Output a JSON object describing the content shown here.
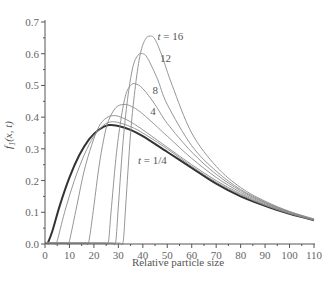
{
  "chart_data": {
    "type": "line",
    "title": "",
    "xlabel": "Relative particle size",
    "ylabel": "f1(x, t)",
    "xlim": [
      0,
      110
    ],
    "ylim": [
      0,
      0.7
    ],
    "grid": false,
    "legend": "none (inline curve labels)",
    "x_ticks": [
      0,
      10,
      20,
      30,
      40,
      50,
      60,
      70,
      80,
      90,
      100,
      110
    ],
    "y_ticks": [
      "0.0",
      "0.1",
      "0.2",
      "0.3",
      "0.4",
      "0.5",
      "0.6",
      "0.7"
    ],
    "annotations": [
      {
        "text": "t = 16",
        "x": 46,
        "y": 0.655
      },
      {
        "text": "12",
        "x": 47,
        "y": 0.585
      },
      {
        "text": "8",
        "x": 44,
        "y": 0.485
      },
      {
        "text": "4",
        "x": 43,
        "y": 0.42
      },
      {
        "text": "t = 1/4",
        "x": 38,
        "y": 0.265
      }
    ],
    "series": [
      {
        "name": "t = 1/4",
        "thick": true,
        "points": [
          [
            1,
            0
          ],
          [
            3,
            0.04
          ],
          [
            6,
            0.12
          ],
          [
            10,
            0.21
          ],
          [
            14,
            0.28
          ],
          [
            18,
            0.33
          ],
          [
            22,
            0.36
          ],
          [
            26,
            0.375
          ],
          [
            30,
            0.372
          ],
          [
            35,
            0.36
          ],
          [
            40,
            0.34
          ],
          [
            50,
            0.29
          ],
          [
            60,
            0.24
          ],
          [
            70,
            0.19
          ],
          [
            80,
            0.15
          ],
          [
            90,
            0.12
          ],
          [
            100,
            0.095
          ],
          [
            110,
            0.075
          ]
        ]
      },
      {
        "name": "t (unlabeled, ~1/2)",
        "thick": false,
        "points": [
          [
            4,
            0
          ],
          [
            5,
            0.01
          ],
          [
            8,
            0.1
          ],
          [
            12,
            0.2
          ],
          [
            16,
            0.28
          ],
          [
            20,
            0.34
          ],
          [
            24,
            0.375
          ],
          [
            27,
            0.385
          ],
          [
            30,
            0.383
          ],
          [
            35,
            0.37
          ],
          [
            40,
            0.35
          ],
          [
            50,
            0.3
          ],
          [
            60,
            0.245
          ],
          [
            70,
            0.195
          ],
          [
            80,
            0.155
          ],
          [
            90,
            0.122
          ],
          [
            100,
            0.096
          ],
          [
            110,
            0.075
          ]
        ]
      },
      {
        "name": "t (unlabeled, ~1)",
        "thick": false,
        "points": [
          [
            9,
            0
          ],
          [
            10,
            0.01
          ],
          [
            13,
            0.12
          ],
          [
            16,
            0.23
          ],
          [
            19,
            0.31
          ],
          [
            22,
            0.37
          ],
          [
            25,
            0.397
          ],
          [
            28,
            0.405
          ],
          [
            31,
            0.4
          ],
          [
            35,
            0.385
          ],
          [
            40,
            0.36
          ],
          [
            50,
            0.305
          ],
          [
            60,
            0.25
          ],
          [
            70,
            0.2
          ],
          [
            80,
            0.158
          ],
          [
            90,
            0.124
          ],
          [
            100,
            0.097
          ],
          [
            110,
            0.076
          ]
        ]
      },
      {
        "name": "t = 4",
        "thick": false,
        "points": [
          [
            17,
            0
          ],
          [
            18,
            0.01
          ],
          [
            20,
            0.12
          ],
          [
            22,
            0.24
          ],
          [
            24,
            0.33
          ],
          [
            26,
            0.39
          ],
          [
            29,
            0.43
          ],
          [
            32,
            0.44
          ],
          [
            35,
            0.435
          ],
          [
            40,
            0.41
          ],
          [
            50,
            0.34
          ],
          [
            60,
            0.27
          ],
          [
            70,
            0.21
          ],
          [
            80,
            0.163
          ],
          [
            90,
            0.127
          ],
          [
            100,
            0.099
          ],
          [
            110,
            0.077
          ]
        ]
      },
      {
        "name": "t = 8",
        "thick": false,
        "points": [
          [
            25,
            0
          ],
          [
            26,
            0.01
          ],
          [
            27,
            0.1
          ],
          [
            29,
            0.27
          ],
          [
            31,
            0.39
          ],
          [
            33,
            0.47
          ],
          [
            35,
            0.5
          ],
          [
            37,
            0.505
          ],
          [
            40,
            0.49
          ],
          [
            45,
            0.44
          ],
          [
            50,
            0.38
          ],
          [
            60,
            0.29
          ],
          [
            70,
            0.22
          ],
          [
            80,
            0.168
          ],
          [
            90,
            0.13
          ],
          [
            100,
            0.1
          ],
          [
            110,
            0.077
          ]
        ]
      },
      {
        "name": "t = 12",
        "thick": false,
        "points": [
          [
            28,
            0
          ],
          [
            29,
            0.01
          ],
          [
            30,
            0.12
          ],
          [
            32,
            0.33
          ],
          [
            34,
            0.47
          ],
          [
            36,
            0.56
          ],
          [
            38,
            0.595
          ],
          [
            40,
            0.6
          ],
          [
            42,
            0.585
          ],
          [
            46,
            0.52
          ],
          [
            50,
            0.44
          ],
          [
            60,
            0.31
          ],
          [
            70,
            0.23
          ],
          [
            80,
            0.172
          ],
          [
            90,
            0.132
          ],
          [
            100,
            0.101
          ],
          [
            110,
            0.078
          ]
        ]
      },
      {
        "name": "t = 16",
        "thick": false,
        "points": [
          [
            31,
            0
          ],
          [
            32,
            0.01
          ],
          [
            33,
            0.12
          ],
          [
            35,
            0.35
          ],
          [
            37,
            0.5
          ],
          [
            39,
            0.6
          ],
          [
            41,
            0.645
          ],
          [
            43,
            0.656
          ],
          [
            45,
            0.645
          ],
          [
            48,
            0.59
          ],
          [
            52,
            0.5
          ],
          [
            60,
            0.35
          ],
          [
            70,
            0.245
          ],
          [
            80,
            0.178
          ],
          [
            90,
            0.135
          ],
          [
            100,
            0.103
          ],
          [
            110,
            0.079
          ]
        ]
      }
    ],
    "colors": {
      "thick_curve": "#333333",
      "thin_curve": "#8a8a8a",
      "axis": "#555555"
    }
  }
}
